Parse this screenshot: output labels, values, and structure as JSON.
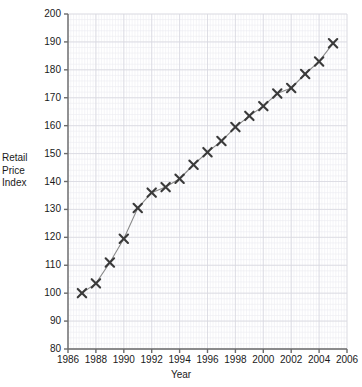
{
  "chart_data": {
    "type": "line",
    "title": "",
    "xlabel": "Year",
    "ylabel": "Retail Price Index",
    "ylabel_lines": [
      "Retail",
      "Price",
      "Index"
    ],
    "xlim": [
      1986,
      2006
    ],
    "ylim": [
      80,
      200
    ],
    "grid": true,
    "grid_major_x_step": 2,
    "grid_major_y_step": 10,
    "grid_minor_x_step": 0.2,
    "grid_minor_y_step": 2,
    "legend": "none",
    "marker": "x",
    "series_color": "#3a3a3a",
    "grid_color": "#d8d8e0",
    "minor_grid_color": "#ececf2",
    "axis_color": "#6b6b6b",
    "xticks": [
      1986,
      1988,
      1990,
      1992,
      1994,
      1996,
      1998,
      2000,
      2002,
      2004,
      2006
    ],
    "xtick_labels": [
      "1986",
      "1988",
      "1990",
      "1992",
      "1994",
      "1996",
      "1998",
      "2000",
      "2002",
      "2004",
      "2006"
    ],
    "yticks": [
      80,
      90,
      100,
      110,
      120,
      130,
      140,
      150,
      160,
      170,
      180,
      190,
      200
    ],
    "ytick_labels": [
      "80",
      "90",
      "100",
      "110",
      "120",
      "130",
      "140",
      "150",
      "160",
      "170",
      "180",
      "190",
      "200"
    ],
    "x": [
      1987,
      1988,
      1989,
      1990,
      1991,
      1992,
      1993,
      1994,
      1995,
      1996,
      1997,
      1998,
      1999,
      2000,
      2001,
      2002,
      2003,
      2004,
      2005
    ],
    "values": [
      100.0,
      103.5,
      111.0,
      119.5,
      130.5,
      136.0,
      138.0,
      141.0,
      146.0,
      150.5,
      154.5,
      159.5,
      163.5,
      167.0,
      171.5,
      173.5,
      178.5,
      183.0,
      189.5
    ],
    "series": [
      {
        "name": "Retail Price Index",
        "x": [
          1987,
          1988,
          1989,
          1990,
          1991,
          1992,
          1993,
          1994,
          1995,
          1996,
          1997,
          1998,
          1999,
          2000,
          2001,
          2002,
          2003,
          2004,
          2005
        ],
        "values": [
          100.0,
          103.5,
          111.0,
          119.5,
          130.5,
          136.0,
          138.0,
          141.0,
          146.0,
          150.5,
          154.5,
          159.5,
          163.5,
          167.0,
          171.5,
          173.5,
          178.5,
          183.0,
          189.5
        ]
      }
    ]
  }
}
